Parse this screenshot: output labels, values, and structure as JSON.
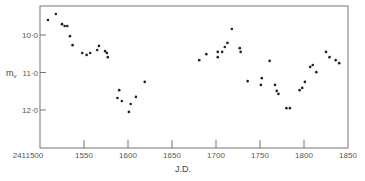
{
  "chart_data": {
    "type": "scatter",
    "title": "",
    "xlabel": "J.D.",
    "ylabel": "m_v",
    "ylabel_main": "m",
    "ylabel_sub": "v",
    "xlim": [
      1500,
      1850
    ],
    "ylim": [
      9.2,
      13.0
    ],
    "y_inverted": true,
    "grid": false,
    "legend": null,
    "x_ticks": [
      {
        "value": 1500,
        "label": "2411500"
      },
      {
        "value": 1550,
        "label": "1550"
      },
      {
        "value": 1600,
        "label": "1600"
      },
      {
        "value": 1650,
        "label": "1650"
      },
      {
        "value": 1700,
        "label": "1700"
      },
      {
        "value": 1750,
        "label": "1750"
      },
      {
        "value": 1800,
        "label": "1800"
      },
      {
        "value": 1850,
        "label": "1850"
      }
    ],
    "y_ticks": [
      {
        "value": 10.0,
        "label": "10·0"
      },
      {
        "value": 11.0,
        "label": "11·0"
      },
      {
        "value": 12.0,
        "label": "12·0"
      }
    ],
    "x_offset_note": "J.D. 2411500 + value",
    "points": [
      {
        "x": 1509,
        "y": 9.6
      },
      {
        "x": 1518,
        "y": 9.44
      },
      {
        "x": 1525,
        "y": 9.71
      },
      {
        "x": 1528,
        "y": 9.76
      },
      {
        "x": 1531,
        "y": 9.76
      },
      {
        "x": 1534,
        "y": 10.03
      },
      {
        "x": 1537,
        "y": 10.27
      },
      {
        "x": 1548,
        "y": 10.48
      },
      {
        "x": 1553,
        "y": 10.53
      },
      {
        "x": 1557,
        "y": 10.48
      },
      {
        "x": 1565,
        "y": 10.4
      },
      {
        "x": 1567,
        "y": 10.29
      },
      {
        "x": 1574,
        "y": 10.43
      },
      {
        "x": 1576,
        "y": 10.48
      },
      {
        "x": 1577,
        "y": 10.59
      },
      {
        "x": 1590,
        "y": 11.47
      },
      {
        "x": 1588,
        "y": 11.68
      },
      {
        "x": 1593,
        "y": 11.76
      },
      {
        "x": 1603,
        "y": 11.84
      },
      {
        "x": 1609,
        "y": 11.65
      },
      {
        "x": 1601,
        "y": 12.05
      },
      {
        "x": 1619,
        "y": 11.25
      },
      {
        "x": 1681,
        "y": 10.67
      },
      {
        "x": 1689,
        "y": 10.51
      },
      {
        "x": 1702,
        "y": 10.45
      },
      {
        "x": 1702,
        "y": 10.59
      },
      {
        "x": 1707,
        "y": 10.45
      },
      {
        "x": 1710,
        "y": 10.32
      },
      {
        "x": 1713,
        "y": 10.21
      },
      {
        "x": 1718,
        "y": 9.84
      },
      {
        "x": 1727,
        "y": 10.35
      },
      {
        "x": 1728,
        "y": 10.45
      },
      {
        "x": 1736,
        "y": 11.23
      },
      {
        "x": 1752,
        "y": 11.15
      },
      {
        "x": 1751,
        "y": 11.33
      },
      {
        "x": 1761,
        "y": 10.69
      },
      {
        "x": 1767,
        "y": 11.33
      },
      {
        "x": 1769,
        "y": 11.49
      },
      {
        "x": 1771,
        "y": 11.57
      },
      {
        "x": 1780,
        "y": 11.95
      },
      {
        "x": 1784,
        "y": 11.95
      },
      {
        "x": 1795,
        "y": 11.47
      },
      {
        "x": 1798,
        "y": 11.41
      },
      {
        "x": 1801,
        "y": 11.25
      },
      {
        "x": 1807,
        "y": 10.85
      },
      {
        "x": 1810,
        "y": 10.8
      },
      {
        "x": 1814,
        "y": 10.99
      },
      {
        "x": 1825,
        "y": 10.45
      },
      {
        "x": 1829,
        "y": 10.59
      },
      {
        "x": 1836,
        "y": 10.67
      },
      {
        "x": 1840,
        "y": 10.75
      }
    ]
  },
  "layout": {
    "plot_left": 40,
    "plot_right": 348,
    "plot_top": 6,
    "plot_bottom": 148
  },
  "colors": {
    "points": "#222222",
    "axis": "#666666",
    "text": "#555555"
  }
}
